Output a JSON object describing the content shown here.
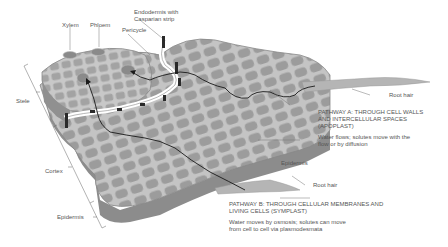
{
  "diagram": {
    "type": "root-cross-section-illustration",
    "colors": {
      "cell_fill": "#9a9a9a",
      "cell_wall": "#c8c8c8",
      "tissue_side": "#8a8a8a",
      "apoplast_path": "#ffffff",
      "casparian_strip": "#2a2a2a",
      "pathway_line": "#1a1a1a",
      "label_text": "#555555"
    }
  },
  "labels": {
    "xylem": "Xylem",
    "phloem": "Phloem",
    "endodermis_line1": "Endodermis with",
    "endodermis_line2": "Casparian strip",
    "pericycle": "Pericycle",
    "stele": "Stele",
    "cortex": "Cortex",
    "epidermis_left": "Epidermis",
    "epidermis_right": "Epidermis",
    "root_hair_top": "Root hair",
    "root_hair_bottom": "Root hair"
  },
  "pathway_a": {
    "title_line1": "PATHWAY A: THROUGH CELL WALLS",
    "title_line2": "AND INTERCELLULAR SPACES",
    "title_line3": "(APOPLAST)",
    "desc_line1": "Water flows; solutes move with the",
    "desc_line2": "flow or by diffusion"
  },
  "pathway_b": {
    "title_line1": "PATHWAY B: THROUGH CELLULAR MEMBRANES AND",
    "title_line2": "LIVING CELLS (SYMPLAST)",
    "desc_line1": "Water moves by osmosis; solutes can move",
    "desc_line2": "from cell to cell via plasmodesmata"
  }
}
